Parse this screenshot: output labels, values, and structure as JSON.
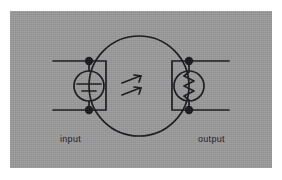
{
  "figure": {
    "kind": "circuit-schematic-diagram",
    "panel": {
      "background_color": "#9a9a9a",
      "ink_color": "#16161a"
    },
    "labels": {
      "input": "input",
      "output": "output"
    },
    "elements": {
      "boundary_circle": {
        "name": "system-boundary-circle",
        "center_x": 129,
        "center_y": 75,
        "radius": 50
      },
      "source": {
        "name": "voltage-source-symbol",
        "center_x": 79,
        "center_y": 75,
        "radius": 15
      },
      "resistor": {
        "name": "resistor-symbol",
        "center_x": 179,
        "center_y": 75,
        "radius": 15
      },
      "coupling_arrows": {
        "name": "wireless-coupling-arrows",
        "count": 2,
        "direction": "up-right"
      },
      "nodes": {
        "name": "terminal-node-dots",
        "count": 4,
        "positions": [
          {
            "x": 79,
            "y": 50
          },
          {
            "x": 79,
            "y": 99
          },
          {
            "x": 179,
            "y": 50
          },
          {
            "x": 179,
            "y": 99
          }
        ]
      },
      "leads": {
        "name": "input-output-lead-wires",
        "input_top_y": 50,
        "input_bottom_y": 99,
        "output_top_y": 50,
        "output_bottom_y": 99
      }
    }
  }
}
